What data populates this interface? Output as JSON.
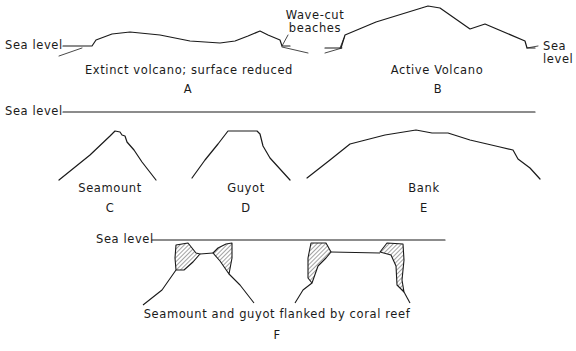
{
  "panels": {
    "A": {
      "letter": "A",
      "caption": "Extinct volcano; surface reduced",
      "sea_level": "Sea level"
    },
    "B": {
      "letter": "B",
      "caption": "Active Volcano",
      "callout": "Wave-cut beaches",
      "callout_line1": "Wave-cut",
      "callout_line2": "beaches",
      "sea_level_line1": "Sea",
      "sea_level_line2": "level"
    },
    "CDE": {
      "sea_level": "Sea level"
    },
    "C": {
      "letter": "C",
      "caption": "Seamount"
    },
    "D": {
      "letter": "D",
      "caption": "Guyot"
    },
    "E": {
      "letter": "E",
      "caption": "Bank"
    },
    "F": {
      "letter": "F",
      "caption": "Seamount and guyot flanked by coral reef",
      "sea_level": "Sea level"
    }
  },
  "colors": {
    "ink": "#1a1a1a",
    "background": "#ffffff"
  }
}
